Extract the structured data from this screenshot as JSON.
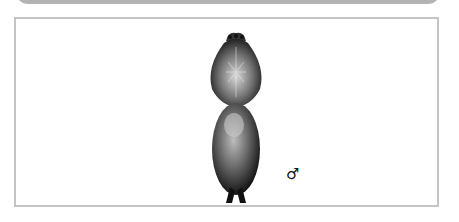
{
  "figure": {
    "sex_symbol": "♂",
    "colors": {
      "frame_border": "#c4c4c4",
      "top_bar": "#b3b3b3",
      "ink": "#1a1a1a"
    }
  }
}
